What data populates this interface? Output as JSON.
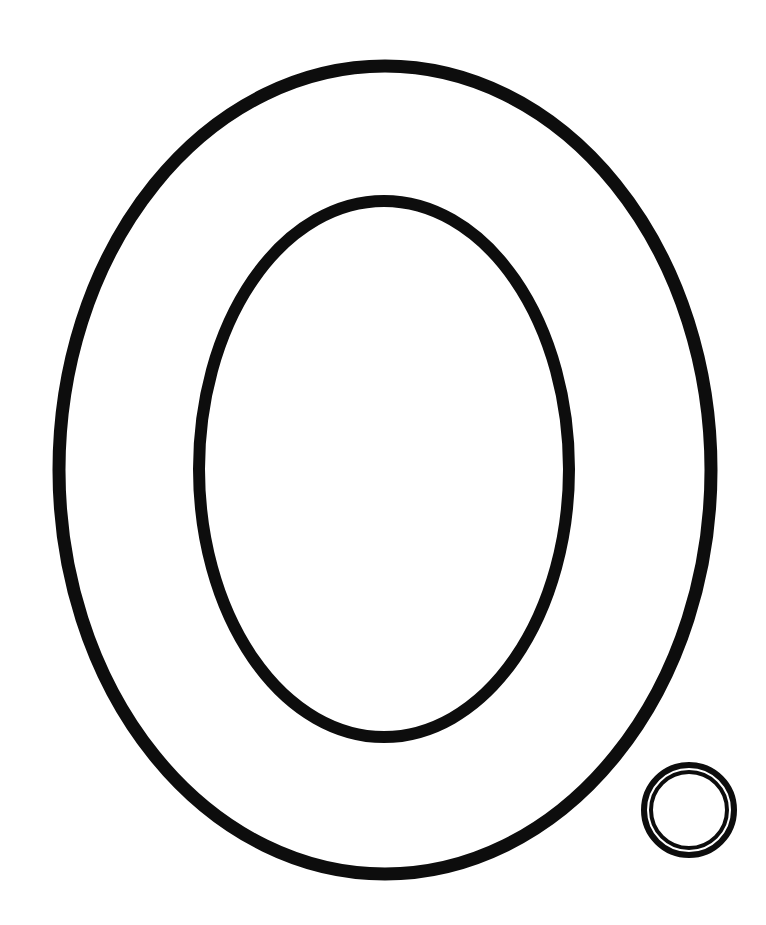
{
  "page": {
    "title": "Letter O coloring page",
    "letter": "O",
    "background_color": "#ffffff",
    "stroke_color": "#0d0d0d"
  },
  "letter_outline": {
    "outer": {
      "cx": 385,
      "cy": 470,
      "rx": 326,
      "ry": 404,
      "stroke_width": 13
    },
    "inner": {
      "cx": 384,
      "cy": 469,
      "rx": 185,
      "ry": 268,
      "stroke_width": 12
    }
  },
  "small_circle": {
    "cx": 689,
    "cy": 810,
    "outer_r": 45,
    "outer_stroke": 6,
    "inner_r": 38,
    "inner_stroke": 4
  }
}
